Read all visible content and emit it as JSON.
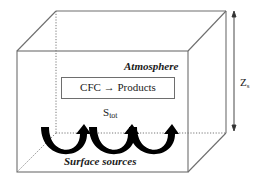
{
  "diagram": {
    "type": "box-model",
    "title": "",
    "labels": {
      "atmosphere": "Atmosphere",
      "reaction": "CFC → Products",
      "source_main": "S",
      "source_sub": "tot",
      "surface": "Surface sources",
      "height_main": "Z",
      "height_sub": "s"
    },
    "elements": {
      "box": "3D rectangular box representing the atmosphere column",
      "reaction_box": "rectangle containing CFC conversion reaction",
      "flux_arrows_count": 3,
      "height_arrow": "double-headed vertical arrow indicating column height"
    },
    "colors": {
      "lines": "#6e6e6e",
      "arrows": "#000000",
      "text": "#1a1a1a",
      "background": "#ffffff"
    }
  }
}
